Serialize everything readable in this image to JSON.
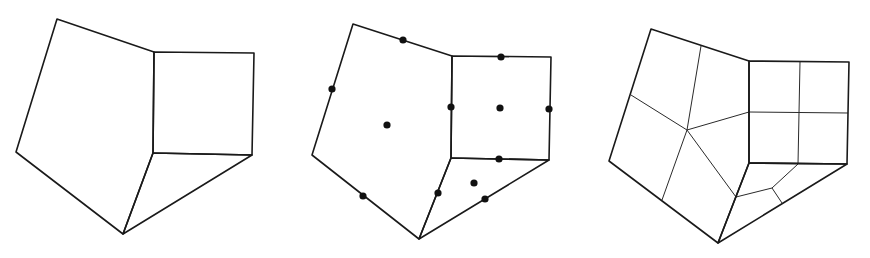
{
  "figure": {
    "colors": {
      "stroke": "#1a1a1a",
      "node": "#111111",
      "background": "#ffffff"
    },
    "panels": [
      {
        "id": "coarse-mesh",
        "faces": [
          [
            [
              57,
              19
            ],
            [
              154,
              52
            ],
            [
              153,
              153
            ],
            [
              123,
              234
            ],
            [
              16,
              152
            ]
          ],
          [
            [
              154,
              52
            ],
            [
              254,
              53
            ],
            [
              252,
              155
            ],
            [
              153,
              153
            ]
          ],
          [
            [
              153,
              153
            ],
            [
              252,
              155
            ],
            [
              123,
              234
            ]
          ]
        ],
        "inner_edges": [],
        "nodes": []
      },
      {
        "id": "mesh-with-midpoints",
        "faces": [
          [
            [
              353,
              24
            ],
            [
              452,
              56
            ],
            [
              451,
              158
            ],
            [
              419,
              239
            ],
            [
              312,
              155
            ]
          ],
          [
            [
              452,
              56
            ],
            [
              551,
              57
            ],
            [
              549,
              160
            ],
            [
              451,
              158
            ]
          ],
          [
            [
              451,
              158
            ],
            [
              549,
              160
            ],
            [
              419,
              239
            ]
          ]
        ],
        "inner_edges": [],
        "nodes": [
          [
            403,
            40
          ],
          [
            332,
            89
          ],
          [
            387,
            125
          ],
          [
            363,
            196
          ],
          [
            501,
            57
          ],
          [
            451,
            107
          ],
          [
            500,
            108
          ],
          [
            549,
            109
          ],
          [
            499,
            159
          ],
          [
            438,
            193
          ],
          [
            474,
            183
          ],
          [
            485,
            199
          ]
        ]
      },
      {
        "id": "subdivided-mesh",
        "faces": [
          [
            [
              651,
              29
            ],
            [
              749,
              61
            ],
            [
              749,
              163
            ],
            [
              718,
              243
            ],
            [
              609,
              161
            ]
          ],
          [
            [
              749,
              61
            ],
            [
              849,
              62
            ],
            [
              847,
              164
            ],
            [
              749,
              163
            ]
          ],
          [
            [
              749,
              163
            ],
            [
              847,
              164
            ],
            [
              718,
              243
            ]
          ]
        ],
        "inner_edges": [
          [
            [
              687,
              130
            ],
            [
              701,
              46
            ]
          ],
          [
            [
              687,
              130
            ],
            [
              631,
              95
            ]
          ],
          [
            [
              687,
              130
            ],
            [
              749,
              112
            ]
          ],
          [
            [
              687,
              130
            ],
            [
              662,
              200
            ]
          ],
          [
            [
              687,
              130
            ],
            [
              736,
              197
            ]
          ],
          [
            [
              800,
              62
            ],
            [
              798,
              164
            ]
          ],
          [
            [
              749,
              112
            ],
            [
              848,
              113
            ]
          ],
          [
            [
              736,
              197
            ],
            [
              772,
              188
            ]
          ],
          [
            [
              772,
              188
            ],
            [
              798,
              164
            ]
          ],
          [
            [
              772,
              188
            ],
            [
              782,
              203
            ]
          ]
        ],
        "nodes": []
      }
    ]
  }
}
